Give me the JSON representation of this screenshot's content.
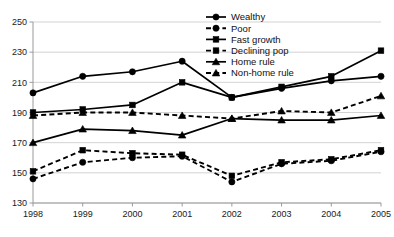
{
  "chart_data": {
    "type": "line",
    "title": "",
    "xlabel": "",
    "ylabel": "",
    "categories": [
      "1998",
      "1999",
      "2000",
      "2001",
      "2002",
      "2003",
      "2004",
      "2005"
    ],
    "x": [
      1998,
      1999,
      2000,
      2001,
      2002,
      2003,
      2004,
      2005
    ],
    "ylim": [
      130,
      250
    ],
    "yticks": [
      130,
      150,
      170,
      190,
      210,
      230,
      250
    ],
    "grid": true,
    "legend_position": "top-center-right",
    "series": [
      {
        "name": "Wealthy",
        "marker": "circle",
        "linestyle": "solid",
        "color": "#000000",
        "values": [
          203,
          214,
          217,
          224,
          200,
          206,
          211,
          214
        ]
      },
      {
        "name": "Poor",
        "marker": "circle",
        "linestyle": "dashed",
        "color": "#000000",
        "values": [
          146,
          157,
          160,
          161,
          144,
          156,
          158,
          164
        ]
      },
      {
        "name": "Fast growth",
        "marker": "square",
        "linestyle": "solid",
        "color": "#000000",
        "values": [
          190,
          192,
          195,
          210,
          200,
          207,
          214,
          231
        ]
      },
      {
        "name": "Declining pop",
        "marker": "square",
        "linestyle": "dashed",
        "color": "#000000",
        "values": [
          151,
          165,
          163,
          162,
          148,
          157,
          159,
          165
        ]
      },
      {
        "name": "Home rule",
        "marker": "triangle",
        "linestyle": "solid",
        "color": "#000000",
        "values": [
          170,
          179,
          178,
          175,
          186,
          185,
          185,
          188
        ]
      },
      {
        "name": "Non-home rule",
        "marker": "triangle",
        "linestyle": "dashed",
        "color": "#000000",
        "values": [
          188,
          190,
          190,
          188,
          186,
          191,
          190,
          201
        ]
      }
    ]
  },
  "legend": {
    "entries": [
      {
        "label": "Wealthy"
      },
      {
        "label": "Poor"
      },
      {
        "label": "Fast growth"
      },
      {
        "label": "Declining pop"
      },
      {
        "label": "Home rule"
      },
      {
        "label": "Non-home rule"
      }
    ]
  },
  "axes": {
    "y_ticks": [
      {
        "label": "250"
      },
      {
        "label": "230"
      },
      {
        "label": "210"
      },
      {
        "label": "190"
      },
      {
        "label": "170"
      },
      {
        "label": "150"
      },
      {
        "label": "130"
      }
    ],
    "x_ticks": [
      {
        "label": "1998"
      },
      {
        "label": "1999"
      },
      {
        "label": "2000"
      },
      {
        "label": "2001"
      },
      {
        "label": "2002"
      },
      {
        "label": "2003"
      },
      {
        "label": "2004"
      },
      {
        "label": "2005"
      }
    ]
  },
  "colors": {
    "line": "#000000",
    "grid": "#c8c8c8",
    "axis": "#9a9a9a",
    "text": "#1a1a1a"
  }
}
